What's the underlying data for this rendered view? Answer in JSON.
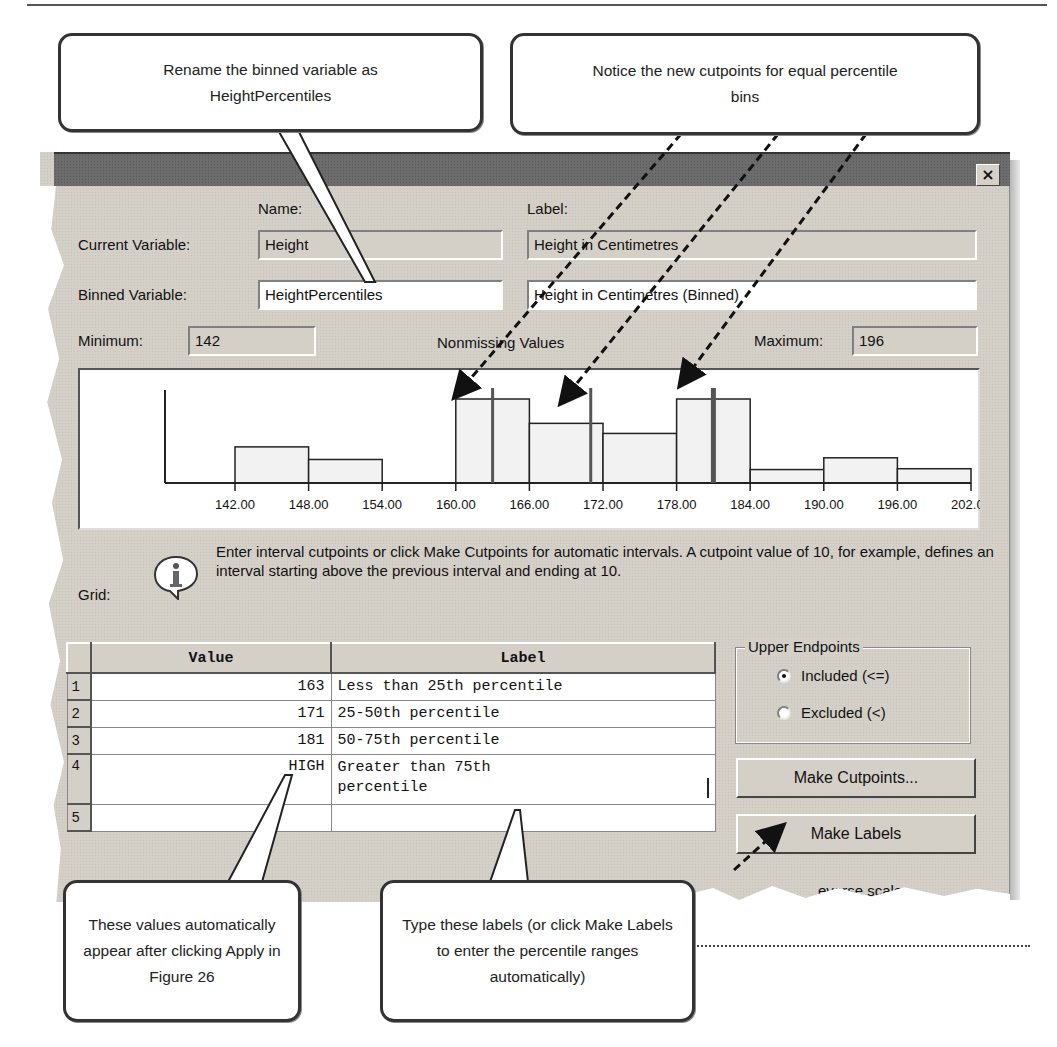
{
  "callouts": {
    "rename": "Rename the binned variable as HeightPercentiles",
    "cutpoints": "Notice the new cutpoints for equal percentile bins",
    "values": "These values automatically appear after clicking Apply in Figure 26",
    "labels": "Type these labels (or click Make Labels to enter the percentile ranges automatically)"
  },
  "dialog": {
    "close_label": "×",
    "name_header": "Name:",
    "label_header": "Label:",
    "current_variable_label": "Current Variable:",
    "binned_variable_label": "Binned Variable:",
    "current_name": "Height",
    "current_label": "Height in Centimetres",
    "binned_name": "HeightPercentiles",
    "binned_label": "Height in Centimetres (Binned)",
    "minimum_label": "Minimum:",
    "minimum_value": "142",
    "nonmissing_label": "Nonmissing Values",
    "maximum_label": "Maximum:",
    "maximum_value": "196",
    "grid_label": "Grid:",
    "info_text": "Enter interval cutpoints or click Make Cutpoints for automatic intervals.  A cutpoint value of 10, for example, defines an interval starting above the previous interval and ending at 10.",
    "upper_endpoints_title": "Upper Endpoints",
    "included_label": "Included (<=)",
    "excluded_label": "Excluded (<)",
    "included_selected": true,
    "make_cutpoints_label": "Make Cutpoints...",
    "make_labels_label": "Make Labels",
    "reverse_scale_label": "everse scale"
  },
  "grid": {
    "headers": {
      "value": "Value",
      "label": "Label"
    },
    "rows": [
      {
        "num": "1",
        "value": "163",
        "label": "Less than 25th percentile"
      },
      {
        "num": "2",
        "value": "171",
        "label": "25-50th percentile"
      },
      {
        "num": "3",
        "value": "181",
        "label": "50-75th percentile"
      },
      {
        "num": "4",
        "value": "HIGH",
        "label": "Greater than 75th",
        "label2": "percentile"
      },
      {
        "num": "5",
        "value": "",
        "label": ""
      }
    ]
  },
  "chart_data": {
    "type": "bar",
    "title": "Nonmissing Values",
    "xlabel": "",
    "ylabel": "",
    "bin_edges": [
      142,
      148,
      154,
      160,
      166,
      172,
      178,
      184,
      190,
      196,
      202
    ],
    "tick_labels": [
      "142.00",
      "148.00",
      "154.00",
      "160.00",
      "166.00",
      "172.00",
      "178.00",
      "184.00",
      "190.00",
      "196.00",
      "202.00"
    ],
    "relative_heights": [
      0.43,
      0.28,
      0,
      1.0,
      0.71,
      0.59,
      1.0,
      0.16,
      0.3,
      0.17
    ],
    "cutpoints": [
      163,
      171,
      181
    ],
    "grid": false,
    "legend": "none"
  },
  "colors": {
    "dialog_bg": "#d4d0c8",
    "titlebar": "#6c6c6c",
    "bar_fill": "#f2f2f2",
    "cutline": "#555555"
  }
}
